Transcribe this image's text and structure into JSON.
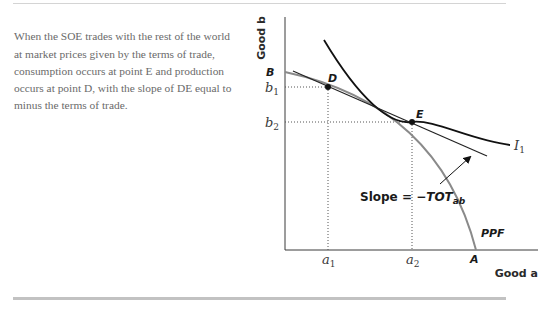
{
  "caption": {
    "text": "When the SOE trades with the rest of the world at market prices given by the terms of trade, consumption occurs at point E and production occurs at point D, with the slope of DE equal to minus the terms of trade."
  },
  "figure": {
    "y_axis_title": "Good b",
    "x_axis_title": "Good a",
    "points": {
      "B": "B",
      "D": "D",
      "E": "E",
      "A": "A"
    },
    "ticks_y": [
      {
        "label": "b",
        "sub": "1"
      },
      {
        "label": "b",
        "sub": "2"
      }
    ],
    "ticks_x": [
      {
        "label": "a",
        "sub": "1"
      },
      {
        "label": "a",
        "sub": "2"
      }
    ],
    "curve_labels": {
      "indifference": "I",
      "indifference_sub": "1",
      "ppf": "PPF"
    },
    "slope_annotation": {
      "prefix": "Slope = −",
      "var": "TOT",
      "sub": "ab"
    },
    "colors": {
      "ppf": "#8a8a8a",
      "indifference": "#111111",
      "tangent": "#222222",
      "axis": "#3a3a3a",
      "guide": "#555555"
    }
  }
}
